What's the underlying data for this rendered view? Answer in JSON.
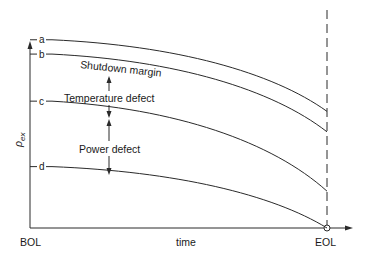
{
  "diagram": {
    "y_axis_label": "ρ",
    "y_axis_subscript": "ex",
    "x_axis_label": "time",
    "x_start_label": "BOL",
    "x_end_label": "EOL",
    "curves": [
      {
        "id": "a",
        "label": "a",
        "start": 0.92,
        "end": 0.57
      },
      {
        "id": "b",
        "label": "b",
        "start": 0.85,
        "end": 0.47
      },
      {
        "id": "c",
        "label": "c",
        "start": 0.62,
        "end": 0.18
      },
      {
        "id": "d",
        "label": "d",
        "start": 0.3,
        "end": 0.0
      }
    ],
    "regions": [
      {
        "name": "shutdown-margin",
        "label": "Shutdown margin"
      },
      {
        "name": "temperature-defect",
        "label": "Temperature defect"
      },
      {
        "name": "power-defect",
        "label": "Power defect"
      }
    ],
    "colors": {
      "line": "#2a2a2a",
      "text": "#1a1a1a",
      "background": "#ffffff"
    }
  }
}
